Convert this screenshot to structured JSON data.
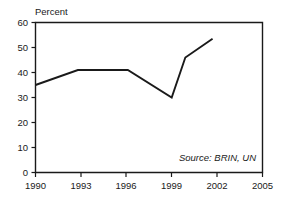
{
  "chart_data": {
    "type": "line",
    "title": "",
    "ylabel": "Percent",
    "xlabel": "",
    "xlim": [
      1990,
      2005
    ],
    "ylim": [
      0,
      60
    ],
    "grid": false,
    "legend": null,
    "x_ticks": [
      "1990",
      "1993",
      "1996",
      "1999",
      "2002",
      "2005"
    ],
    "x_tick_values": [
      1990,
      1993,
      1996,
      1999,
      2002,
      2005
    ],
    "y_ticks": [
      "0",
      "10",
      "20",
      "30",
      "40",
      "50",
      "60"
    ],
    "y_tick_values": [
      0,
      10,
      20,
      30,
      40,
      50,
      60
    ],
    "series": [
      {
        "name": "Percent",
        "x": [
          1990,
          1992.8,
          1996.1,
          1999.0,
          1999.9,
          2001.7
        ],
        "values": [
          35,
          41,
          41,
          30,
          46,
          53.5
        ]
      }
    ],
    "annotations": [
      {
        "name": "source-note",
        "text": "Source: BRIN, UN",
        "style": "italic"
      }
    ]
  },
  "axis_label_percent": "Percent",
  "source_note": "Source: BRIN, UN"
}
